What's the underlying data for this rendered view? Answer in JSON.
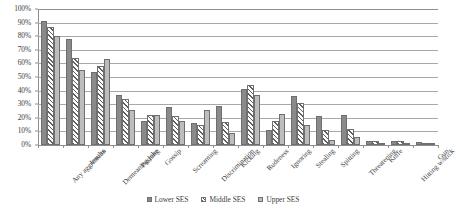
{
  "chart_data": {
    "type": "bar",
    "title": "",
    "subtitle": "",
    "xlabel": "",
    "ylabel": "",
    "ylim": [
      0,
      100
    ],
    "y_ticks": [
      "0%",
      "10%",
      "20%",
      "30%",
      "40%",
      "50%",
      "60%",
      "70%",
      "80%",
      "90%",
      "100%"
    ],
    "y_tick_values": [
      0,
      10,
      20,
      30,
      40,
      50,
      60,
      70,
      80,
      90,
      100
    ],
    "grid": true,
    "legend_position": "bottom",
    "value_unit": "percent",
    "categories": [
      "Any aggression",
      "Insults",
      "Demeaning joke",
      "Pushing",
      "Gossip",
      "Screaming",
      "Discrimination",
      "Kicking",
      "Rudeness",
      "Ignoring",
      "Stealing",
      "Spitting",
      "Threatening",
      "Knife",
      "Hitting w/stick",
      "Gun"
    ],
    "series": [
      {
        "name": "Lower SES",
        "color": "#8a8a8a",
        "fill": "solid",
        "values": [
          91,
          78,
          54,
          37,
          18,
          28,
          16,
          29,
          41,
          11,
          36,
          21,
          22,
          3,
          3,
          2
        ]
      },
      {
        "name": "Middle SES",
        "color": "#5f5f5f",
        "fill": "diagonal-hatch",
        "values": [
          87,
          64,
          58,
          34,
          22,
          21,
          15,
          17,
          44,
          18,
          31,
          11,
          12,
          3,
          3,
          1
        ]
      },
      {
        "name": "Upper SES",
        "color": "#bdbdbd",
        "fill": "solid-light",
        "values": [
          80,
          55,
          63,
          26,
          22,
          18,
          26,
          9,
          37,
          23,
          15,
          4,
          6,
          1,
          1,
          1
        ]
      }
    ]
  },
  "legend": {
    "items": [
      {
        "label": "Lower SES",
        "key": "lower"
      },
      {
        "label": "Middle SES",
        "key": "middle"
      },
      {
        "label": "Upper SES",
        "key": "upper"
      }
    ]
  }
}
